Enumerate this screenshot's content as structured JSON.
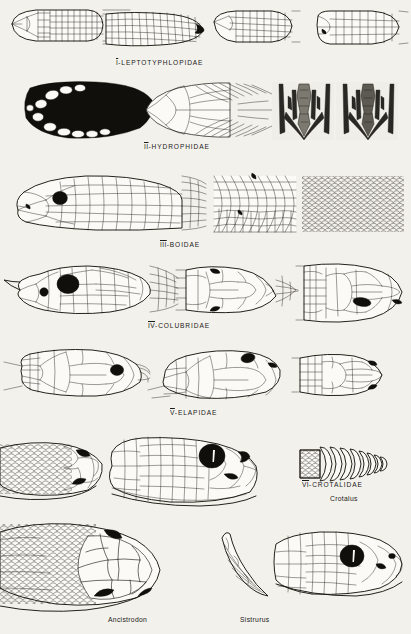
{
  "plate": {
    "background_color": "#f3f1ec",
    "ink_color": "#17160f",
    "description": "Comparative plate of snake head scalation by family"
  },
  "sections": [
    {
      "id": "leptotyphlopidae",
      "numeral": "I",
      "separator": "-",
      "family": "LEPTOTYPHLOPIDAE",
      "caption": "I-LEPTOTYPHLOPIDAE",
      "figure_count": 4,
      "figures": [
        "dorsal head scales",
        "lateral head scales",
        "dorsal head scales",
        "lateral head scales"
      ]
    },
    {
      "id": "hydrophidae",
      "numeral": "II",
      "separator": "-",
      "family": "HYDROPHIDAE",
      "caption": "II-HYDROPHIDAE",
      "figure_count": 4,
      "figures": [
        "shaded lateral head",
        "dorsal head scales",
        "skull dorsal view",
        "skull ventral view"
      ]
    },
    {
      "id": "boidae",
      "numeral": "III",
      "separator": "-",
      "family": "BOIDAE",
      "caption": "III-BOIDAE",
      "figure_count": 3,
      "figures": [
        "lateral head with eye",
        "dorsal head scales",
        "body scale field"
      ]
    },
    {
      "id": "colubridae",
      "numeral": "IV",
      "separator": "-",
      "family": "COLUBRIDAE",
      "caption": "IV-COLUBRIDAE",
      "figure_count": 3,
      "figures": [
        "lateral head with large eye",
        "dorsal head plates",
        "dorsal head plates enlarged"
      ]
    },
    {
      "id": "elapidae",
      "numeral": "V",
      "separator": "-",
      "family": "ELAPIDAE",
      "caption": "V-ELAPIDAE",
      "figure_count": 3,
      "figures": [
        "lateral head",
        "dorsolateral head",
        "dorsal head plates"
      ]
    },
    {
      "id": "crotalidae",
      "numeral": "VI",
      "separator": "-",
      "family": "CROTALIDAE",
      "caption": "VI-CROTALIDAE",
      "figure_count": 5,
      "figures": [
        "dorsal head scales",
        "lateral head with pit",
        "rattle",
        "lateral head Ancistrodon",
        "lateral head Sistrurus"
      ]
    }
  ],
  "genus_labels": [
    {
      "id": "crotalus",
      "name": "Crotalus"
    },
    {
      "id": "ancistrodon",
      "name": "Ancistrodon"
    },
    {
      "id": "sistrurus",
      "name": "Sistrurus"
    }
  ]
}
